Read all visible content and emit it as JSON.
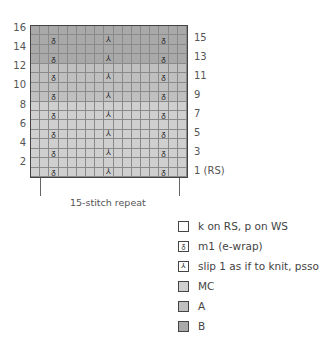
{
  "chart_data": {
    "type": "table",
    "columns": 17,
    "rows": 16,
    "repeat_label": "15-stitch repeat",
    "left_row_labels": [
      "16",
      "14",
      "12",
      "10",
      "8",
      "6",
      "4",
      "2"
    ],
    "right_row_labels": [
      "15",
      "13",
      "11",
      "9",
      "7",
      "5",
      "3",
      "1 (RS)"
    ],
    "color_bands": [
      {
        "rows": [
          13,
          14,
          15,
          16
        ],
        "color": "B",
        "hex": "#a9a9a9"
      },
      {
        "rows": [
          9,
          10,
          11,
          12
        ],
        "color": "A",
        "hex": "#c0c0c0"
      },
      {
        "rows": [
          1,
          2,
          3,
          4,
          5,
          6,
          7,
          8
        ],
        "color": "MC",
        "hex": "#cfcfcf"
      }
    ],
    "symbol_rows": [
      1,
      3,
      5,
      7,
      9,
      11,
      13,
      15
    ],
    "symbols": [
      {
        "column": 3,
        "symbol": "m1 (e-wrap)"
      },
      {
        "column": 9,
        "symbol": "slip 1 as if to knit, psso"
      },
      {
        "column": 15,
        "symbol": "m1 (e-wrap)"
      }
    ]
  },
  "legend": [
    {
      "glyph": "",
      "label": "k on RS, p on WS",
      "fill": "#ffffff"
    },
    {
      "glyph": "ᵹ",
      "label": "m1 (e-wrap)",
      "fill": "#ffffff"
    },
    {
      "glyph": "⅄",
      "label": "slip 1 as if to knit, psso",
      "fill": "#ffffff"
    },
    {
      "glyph": "",
      "label": "MC",
      "fill": "#cfcfcf"
    },
    {
      "glyph": "",
      "label": "A",
      "fill": "#c0c0c0"
    },
    {
      "glyph": "",
      "label": "B",
      "fill": "#a9a9a9"
    }
  ],
  "labels": {
    "left": [
      "16",
      "14",
      "12",
      "10",
      "8",
      "6",
      "4",
      "2"
    ],
    "right": [
      "15",
      "13",
      "11",
      "9",
      "7",
      "5",
      "3",
      "1 (RS)"
    ],
    "repeat": "15-stitch repeat"
  }
}
